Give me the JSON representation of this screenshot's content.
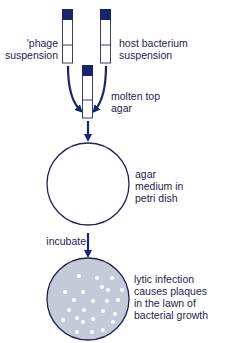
{
  "diagram": {
    "type": "process-flow",
    "colors": {
      "ink": "#1f2350",
      "cap": "#1a2468",
      "tube_outline": "#3a3f66",
      "plate_fill": "#c5cad8",
      "plaque": "#ffffff",
      "background": "#ffffff"
    },
    "tubes": [
      {
        "id": "phage",
        "label_lines": [
          "'phage",
          "suspension"
        ]
      },
      {
        "id": "host",
        "label_lines": [
          "host bacterium",
          "suspension"
        ]
      },
      {
        "id": "top-agar",
        "label_lines": [
          "molten top",
          "agar"
        ]
      }
    ],
    "plate_empty": {
      "label_lines": [
        "agar",
        "medium in",
        "petri dish"
      ]
    },
    "step": {
      "label": "incubate"
    },
    "plate_result": {
      "label_lines": [
        "lytic infection",
        "causes plaques",
        "in the lawn of",
        "bacterial growth"
      ],
      "plaque_count": 24
    }
  }
}
